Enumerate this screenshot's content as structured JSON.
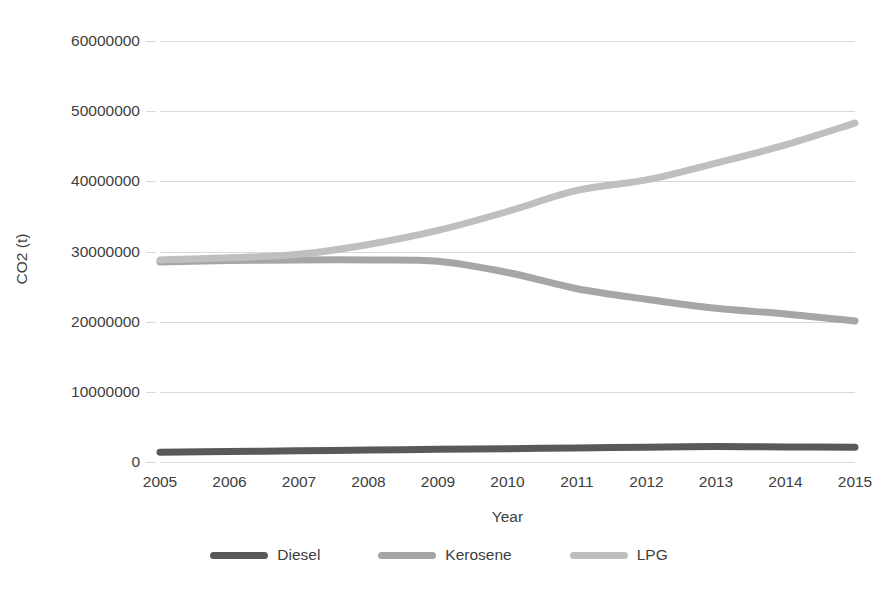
{
  "chart_data": {
    "type": "line",
    "title": "",
    "xlabel": "Year",
    "ylabel": "CO2 (t)",
    "categories": [
      "2005",
      "2006",
      "2007",
      "2008",
      "2009",
      "2010",
      "2011",
      "2012",
      "2013",
      "2014",
      "2015"
    ],
    "x": [
      2005,
      2006,
      2007,
      2008,
      2009,
      2010,
      2011,
      2012,
      2013,
      2014,
      2015
    ],
    "ylim": [
      0,
      60000000
    ],
    "xlim": [
      2005,
      2015
    ],
    "ytick_labels": [
      "0",
      "10000000",
      "20000000",
      "30000000",
      "40000000",
      "50000000",
      "60000000"
    ],
    "ytick_values": [
      0,
      10000000,
      20000000,
      30000000,
      40000000,
      50000000,
      60000000
    ],
    "grid": true,
    "grid_axis": "y",
    "legend_position": "bottom",
    "series": [
      {
        "name": "Diesel",
        "color": "#595959",
        "values": [
          1400000,
          1500000,
          1600000,
          1700000,
          1800000,
          1900000,
          2000000,
          2100000,
          2200000,
          2150000,
          2100000
        ]
      },
      {
        "name": "Kerosene",
        "color": "#a6a6a6",
        "values": [
          28500000,
          28700000,
          28800000,
          28800000,
          28600000,
          27000000,
          24700000,
          23200000,
          21900000,
          21100000,
          20100000
        ]
      },
      {
        "name": "LPG",
        "color": "#bfbfbf",
        "values": [
          28800000,
          29100000,
          29600000,
          31000000,
          33000000,
          35700000,
          38700000,
          40200000,
          42600000,
          45200000,
          48300000
        ]
      }
    ]
  },
  "axes": {
    "y_title": "CO2 (t)",
    "x_title": "Year"
  },
  "legend": {
    "items": [
      {
        "label": "Diesel",
        "color": "#595959",
        "icon": "line-swatch-icon"
      },
      {
        "label": "Kerosene",
        "color": "#a6a6a6",
        "icon": "line-swatch-icon"
      },
      {
        "label": "LPG",
        "color": "#bfbfbf",
        "icon": "line-swatch-icon"
      }
    ]
  },
  "colors": {
    "gridline": "#d9d9d9",
    "text": "#404040",
    "background": "#ffffff"
  }
}
